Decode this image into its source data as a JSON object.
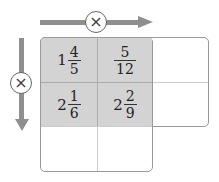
{
  "operator_symbol": "×",
  "grid": {
    "rows": [
      [
        {
          "whole": "1",
          "num": "4",
          "den": "5",
          "shaded": true
        },
        {
          "whole": "",
          "num": "5",
          "den": "12",
          "shaded": true
        },
        {
          "whole": "",
          "num": "",
          "den": "",
          "shaded": false
        }
      ],
      [
        {
          "whole": "2",
          "num": "1",
          "den": "6",
          "shaded": true
        },
        {
          "whole": "2",
          "num": "2",
          "den": "9",
          "shaded": true
        },
        {
          "whole": "",
          "num": "",
          "den": "",
          "shaded": false
        }
      ],
      [
        {
          "whole": "",
          "num": "",
          "den": "",
          "shaded": false
        },
        {
          "whole": "",
          "num": "",
          "den": "",
          "shaded": false
        }
      ]
    ]
  },
  "colors": {
    "shade": "#d3d3d3",
    "arrow": "#8f8f8f",
    "border": "#999999"
  }
}
